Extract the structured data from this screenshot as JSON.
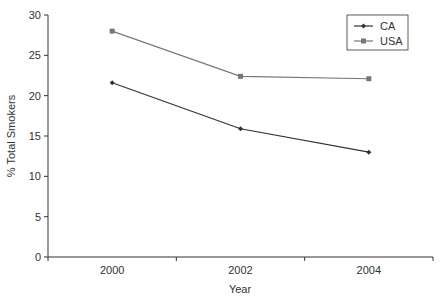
{
  "chart_data": {
    "type": "line",
    "title": "",
    "xlabel": "Year",
    "ylabel": "% Total Smokers",
    "categories": [
      "2000",
      "2002",
      "2004"
    ],
    "series": [
      {
        "name": "CA",
        "values": [
          21.6,
          15.9,
          13.0
        ],
        "color": "#333333",
        "marker": "diamond"
      },
      {
        "name": "USA",
        "values": [
          28.0,
          22.4,
          22.1
        ],
        "color": "#777777",
        "marker": "square"
      }
    ],
    "ylim": [
      0,
      30
    ],
    "yticks": [
      "0",
      "5",
      "10",
      "15",
      "20",
      "25",
      "30"
    ],
    "grid": false,
    "legend_position": "top-right"
  }
}
